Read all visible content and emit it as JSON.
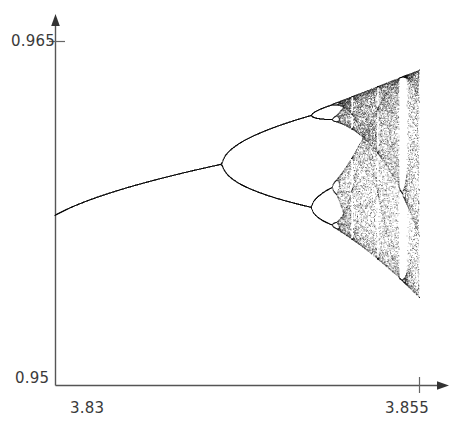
{
  "figure": {
    "title": "",
    "kind": "bifurcation-diagram"
  },
  "axes": {
    "y_top_label": "0.965",
    "y_bottom_label": "0.95",
    "x_left_label": "3.83",
    "x_right_label": "3.855"
  },
  "chart_data": {
    "type": "scatter",
    "title": "",
    "xlabel": "",
    "ylabel": "",
    "xlim": [
      3.83,
      3.855
    ],
    "ylim": [
      0.95,
      0.965
    ],
    "grid": false,
    "legend": null,
    "xticks": [
      3.83,
      3.855
    ],
    "yticks": [
      0.95,
      0.965
    ],
    "features": {
      "period_1_branch": {
        "x_start": 3.83,
        "x_end": 3.8426,
        "y_start": 0.9558,
        "y_end": 0.9589
      },
      "first_bifurcation": {
        "x": 3.8426,
        "y": 0.9589
      },
      "second_bifurcation_upper": {
        "x": 3.8522,
        "y": 0.9633
      },
      "second_bifurcation_lower": {
        "x": 3.8515,
        "y": 0.9554
      },
      "chaos_onset": {
        "x": 3.8536
      },
      "periodic_window": {
        "x_start": 3.8853,
        "x_end": 3.8859
      },
      "chaotic_band_top_at_right": 0.9632,
      "chaotic_band_bottom_at_right": 0.9516
    },
    "series": [
      {
        "name": "attractor",
        "points_note": "dense attractor set of x_{n+1}=r*x_n*(1-x_n) after transients"
      }
    ]
  }
}
